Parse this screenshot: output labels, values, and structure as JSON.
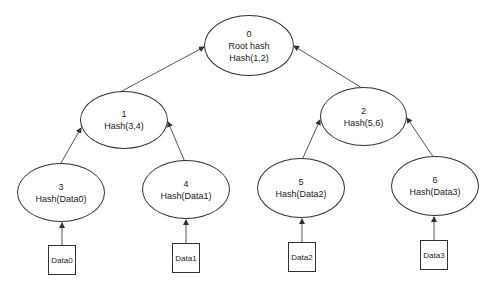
{
  "diagram": {
    "type": "merkle-tree",
    "nodes": [
      {
        "id": "0",
        "lines": [
          "0",
          "Root hash",
          "Hash(1,2)"
        ]
      },
      {
        "id": "1",
        "lines": [
          "1",
          "Hash(3,4)"
        ]
      },
      {
        "id": "2",
        "lines": [
          "2",
          "Hash(5,6)"
        ]
      },
      {
        "id": "3",
        "lines": [
          "3",
          "Hash(Data0)"
        ]
      },
      {
        "id": "4",
        "lines": [
          "4",
          "Hash(Data1)"
        ]
      },
      {
        "id": "5",
        "lines": [
          "5",
          "Hash(Data2)"
        ]
      },
      {
        "id": "6",
        "lines": [
          "6",
          "Hash(Data3)"
        ]
      }
    ],
    "data_blocks": [
      {
        "id": "Data0",
        "label": "Data0"
      },
      {
        "id": "Data1",
        "label": "Data1"
      },
      {
        "id": "Data2",
        "label": "Data2"
      },
      {
        "id": "Data3",
        "label": "Data3"
      }
    ],
    "edges": [
      {
        "from": "1",
        "to": "0"
      },
      {
        "from": "2",
        "to": "0"
      },
      {
        "from": "3",
        "to": "1"
      },
      {
        "from": "4",
        "to": "1"
      },
      {
        "from": "5",
        "to": "2"
      },
      {
        "from": "6",
        "to": "2"
      },
      {
        "from": "Data0",
        "to": "3"
      },
      {
        "from": "Data1",
        "to": "4"
      },
      {
        "from": "Data2",
        "to": "5"
      },
      {
        "from": "Data3",
        "to": "6"
      }
    ],
    "colors": {
      "stroke": "#333333",
      "background": "#ffffff",
      "text": "#222222"
    }
  }
}
